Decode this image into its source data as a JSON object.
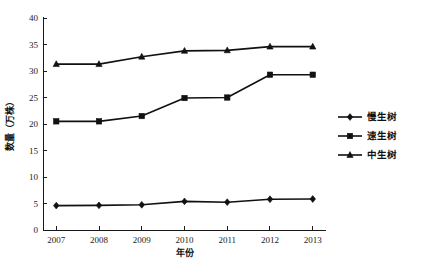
{
  "chart_data": {
    "type": "line",
    "title": "",
    "xlabel": "年份",
    "ylabel": "数量（万株）",
    "categories": [
      "2007",
      "2008",
      "2009",
      "2010",
      "2011",
      "2012",
      "2013"
    ],
    "x": [
      2007,
      2008,
      2009,
      2010,
      2011,
      2012,
      2013
    ],
    "xlim": [
      2006.6,
      2013.4
    ],
    "ylim": [
      0,
      40
    ],
    "yticks": [
      0,
      5,
      10,
      15,
      20,
      25,
      30,
      35,
      40
    ],
    "ytick_labels": [
      "0",
      "5",
      "10",
      "15",
      "20",
      "25",
      "30",
      "35",
      "40"
    ],
    "grid": false,
    "legend_position": "right",
    "series": [
      {
        "name": "慢生树",
        "marker": "diamond",
        "color": "#111111",
        "values": [
          4.6,
          4.65,
          4.75,
          5.4,
          5.25,
          5.8,
          5.85
        ]
      },
      {
        "name": "速生树",
        "marker": "square",
        "color": "#111111",
        "values": [
          20.5,
          20.5,
          21.5,
          24.9,
          25.0,
          29.3,
          29.3
        ]
      },
      {
        "name": "中生树",
        "marker": "triangle",
        "color": "#111111",
        "values": [
          31.3,
          31.3,
          32.7,
          33.8,
          33.9,
          34.6,
          34.6
        ]
      }
    ]
  },
  "legend": {
    "entries": [
      {
        "label": "慢生树",
        "marker": "diamond"
      },
      {
        "label": "速生树",
        "marker": "square"
      },
      {
        "label": "中生树",
        "marker": "triangle"
      }
    ]
  },
  "axes": {
    "x_title": "年份",
    "y_title": "数量（万株）"
  }
}
